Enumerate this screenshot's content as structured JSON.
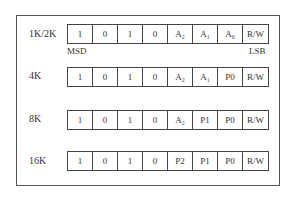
{
  "rows": [
    {
      "label": "1K/2K",
      "bits": [
        "1",
        "0",
        "1",
        "0",
        "A₂",
        "A₁",
        "A₀",
        "R/W"
      ]
    },
    {
      "label": "4K",
      "bits": [
        "1",
        "0",
        "1",
        "0",
        "A₂",
        "A₁",
        "P0",
        "R/W"
      ]
    },
    {
      "label": "8K",
      "bits": [
        "1",
        "0",
        "1",
        "0",
        "A₂",
        "P1",
        "P0",
        "R/W"
      ]
    },
    {
      "label": "16K",
      "bits": [
        "1",
        "0",
        "1",
        "0",
        "P2",
        "P1",
        "P0",
        "R/W"
      ]
    }
  ],
  "markers": {
    "msd": "MSD",
    "lsb": "LSB"
  }
}
